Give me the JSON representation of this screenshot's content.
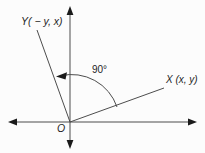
{
  "figure": {
    "type": "geometry-diagram",
    "description_visible_text_only": true,
    "background_color": "#fcfcfc",
    "line_color": "#4d4d4d",
    "arrow_color": "#1a1a1a",
    "text_color": "#1f1f1f",
    "labels": {
      "y_ray": "Y( − y, x)",
      "x_ray": "X (x, y)",
      "angle": "90°",
      "origin": "O"
    }
  }
}
